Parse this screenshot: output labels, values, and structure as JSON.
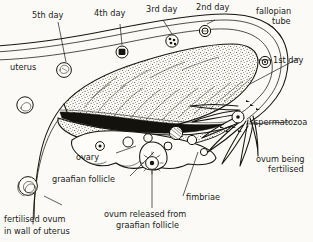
{
  "figure": {
    "background_color": "#fbfaf7",
    "ink_color": "#17150f"
  },
  "labels": {
    "day5": "5th day",
    "day4": "4th day",
    "day3": "3rd day",
    "day2": "2nd day",
    "day1": "1st day",
    "fallopian_tube_line1": "fallopian",
    "fallopian_tube_line2": "tube",
    "uterus": "uterus",
    "ovary": "ovary",
    "graafian_follicle": "graafian follicle",
    "spermatozoa": "spermatozoa",
    "ovum_being_fertilised_line1": "ovum being",
    "ovum_being_fertilised_line2": "fertilised",
    "fimbriae": "fimbriae",
    "ovum_released_line1": "ovum released from",
    "ovum_released_line2": "graafian follicle",
    "fertilised_ovum_line1": "fertilised ovum",
    "fertilised_ovum_line2": "in wall of uterus"
  },
  "structures": {
    "embryo_stages": [
      {
        "name": "1st day",
        "note": "ovum in ampulla of fallopian tube"
      },
      {
        "name": "2nd day",
        "note": "dividing zygote in tube"
      },
      {
        "name": "3rd day",
        "note": "morula in tube"
      },
      {
        "name": "4th day",
        "note": "late morula entering uterus"
      },
      {
        "name": "5th day",
        "note": "blastocyst in uterine cavity"
      }
    ],
    "ovary_follicles": 8,
    "fimbriae_count": 7
  }
}
